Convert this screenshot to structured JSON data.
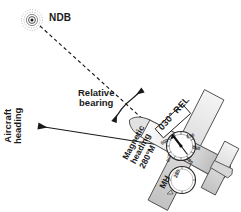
{
  "figure": {
    "background": "#ffffff",
    "ink": "#1a1a1a",
    "fill_light": "#e8e8e8",
    "fill_mid": "#c9c9c9",
    "fill_dark": "#9a9a9a"
  },
  "labels": {
    "ndb": "NDB",
    "relative_bearing": "Relative\nbearing",
    "aircraft_heading": "Aircraft\nheading",
    "magnetic_heading": "Magnetic\nheading\n280°M",
    "mh": "MH",
    "rel_box": "030° REL"
  },
  "adf_rose": {
    "name": "adf-compass-rose",
    "pointer_value": "030",
    "ticks": [
      {
        "label": "030",
        "x": 186,
        "y": 135,
        "rot": -20
      },
      {
        "label": "060",
        "x": 193,
        "y": 145,
        "rot": 10
      },
      {
        "label": "180",
        "x": 189,
        "y": 156,
        "rot": 50
      },
      {
        "label": "270",
        "x": 172,
        "y": 155,
        "rot": 105
      },
      {
        "label": "000",
        "x": 169,
        "y": 142,
        "rot": 150
      }
    ]
  },
  "heading_indicator": {
    "name": "heading-indicator",
    "value": "280"
  },
  "geometry": {
    "ndb_station": {
      "x": 32,
      "y": 20
    },
    "aircraft_nose": {
      "x": 163,
      "y": 145
    },
    "heading_arrow_tip": {
      "x": 36,
      "y": 126
    },
    "relative_bearing_degrees": "030",
    "magnetic_heading_degrees": "280"
  }
}
